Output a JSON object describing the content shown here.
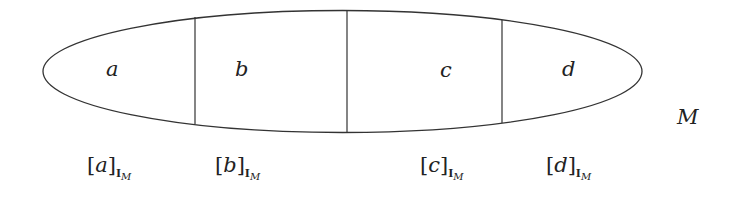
{
  "diagram": {
    "outer_set": {
      "label": "M",
      "shape": "ellipse"
    },
    "regions": [
      {
        "id": "a",
        "label": "a"
      },
      {
        "id": "b",
        "label": "b"
      },
      {
        "id": "c",
        "label": "c"
      },
      {
        "id": "d",
        "label": "d"
      }
    ],
    "dividers": 3,
    "class_labels": [
      {
        "open": "[",
        "var": "a",
        "close": "]",
        "sub_bold": "I",
        "sub_sub": "M"
      },
      {
        "open": "[",
        "var": "b",
        "close": "]",
        "sub_bold": "I",
        "sub_sub": "M"
      },
      {
        "open": "[",
        "var": "c",
        "close": "]",
        "sub_bold": "I",
        "sub_sub": "M"
      },
      {
        "open": "[",
        "var": "d",
        "close": "]",
        "sub_bold": "I",
        "sub_sub": "M"
      }
    ],
    "stroke_color": "#333333"
  }
}
